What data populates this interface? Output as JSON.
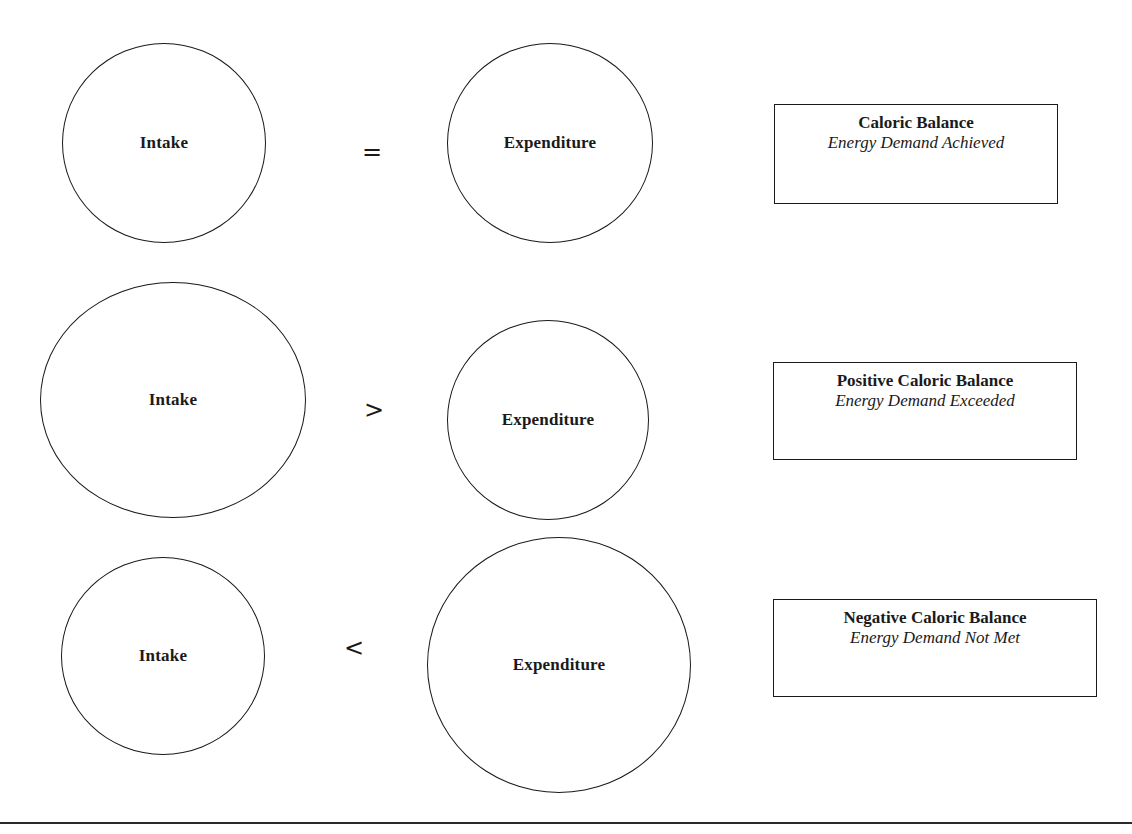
{
  "diagram": {
    "rows": [
      {
        "id": "caloric-balance",
        "intake": {
          "label": "Intake",
          "cx": 164,
          "cy": 143,
          "rx": 102,
          "ry": 100
        },
        "operator": {
          "symbol": "=",
          "x": 372,
          "y": 152
        },
        "expenditure": {
          "label": "Expenditure",
          "cx": 550,
          "cy": 143,
          "rx": 103,
          "ry": 100
        },
        "result": {
          "title": "Caloric Balance",
          "subtitle": "Energy Demand Achieved",
          "x": 774,
          "y": 104,
          "w": 284,
          "h": 100
        }
      },
      {
        "id": "positive-caloric-balance",
        "intake": {
          "label": "Intake",
          "cx": 173,
          "cy": 400,
          "rx": 133,
          "ry": 118
        },
        "operator": {
          "symbol": ">",
          "x": 374,
          "y": 410
        },
        "expenditure": {
          "label": "Expenditure",
          "cx": 548,
          "cy": 420,
          "rx": 101,
          "ry": 100
        },
        "result": {
          "title": "Positive Caloric Balance",
          "subtitle": "Energy Demand Exceeded",
          "x": 773,
          "y": 362,
          "w": 304,
          "h": 98
        }
      },
      {
        "id": "negative-caloric-balance",
        "intake": {
          "label": "Intake",
          "cx": 163,
          "cy": 656,
          "rx": 102,
          "ry": 99
        },
        "operator": {
          "symbol": "<",
          "x": 354,
          "y": 648
        },
        "expenditure": {
          "label": "Expenditure",
          "cx": 559,
          "cy": 665,
          "rx": 132,
          "ry": 128
        },
        "result": {
          "title": "Negative Caloric Balance",
          "subtitle": "Energy Demand Not Met",
          "x": 773,
          "y": 599,
          "w": 324,
          "h": 98
        }
      }
    ]
  },
  "colors": {
    "stroke": "#1a1a1a",
    "background": "#ffffff"
  }
}
